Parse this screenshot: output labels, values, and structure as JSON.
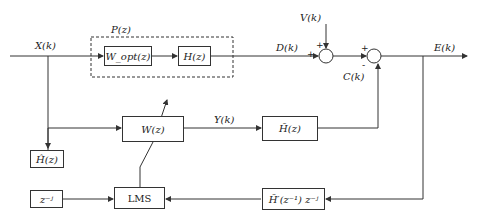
{
  "diagram": {
    "type": "adaptive filter block diagram (FxLMS active noise control)",
    "signals": {
      "input": "X(k)",
      "desired": "D(k)",
      "noise": "V(k)",
      "error": "E(k)",
      "cancel": "C(k)",
      "filter_output": "Y(k)"
    },
    "group_label": "P(z)",
    "blocks": {
      "wopt": "W_opt(z)",
      "h": "H(z)",
      "w": "W(z)",
      "h_bar": "H̄(z)",
      "h_hat": "Ĥ(z)",
      "delay": "z⁻ʲ",
      "lms": "LMS",
      "h_bar_inv": "H̄′(z⁻¹) z⁻ʲ"
    },
    "signs": {
      "sum1_left": "+",
      "sum1_top": "+",
      "sum2_left": "+",
      "sum2_bottom": "-"
    },
    "colors": {
      "line": "#333333",
      "text": "#222222",
      "background": "#ffffff"
    }
  }
}
